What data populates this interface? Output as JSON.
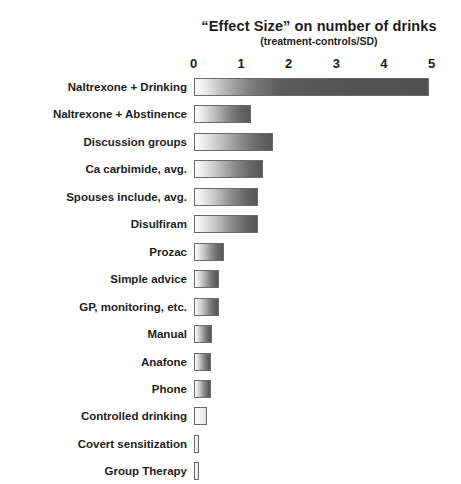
{
  "chart_data": {
    "type": "bar",
    "orientation": "horizontal",
    "title": "“Effect Size” on number of drinks",
    "subtitle": "(treatment-controls/SD)",
    "xlabel": "",
    "ylabel": "",
    "xlim": [
      0,
      5
    ],
    "xticks": [
      0,
      1,
      2,
      3,
      4,
      5
    ],
    "xtick_labels": [
      "0",
      "1",
      "2",
      "3",
      "4",
      "5"
    ],
    "grid": false,
    "legend": false,
    "categories": [
      "Naltrexone + Drinking",
      "Naltrexone + Abstinence",
      "Discussion groups",
      "Ca carbimide, avg.",
      "Spouses include, avg.",
      "Disulfiram",
      "Prozac",
      "Simple advice",
      "GP, monitoring, etc.",
      "Manual",
      "Anafone",
      "Phone",
      "Controlled drinking",
      "Covert sensitization",
      "Group Therapy"
    ],
    "values": [
      4.95,
      1.2,
      1.67,
      1.45,
      1.36,
      1.36,
      0.64,
      0.53,
      0.53,
      0.39,
      0.37,
      0.36,
      0.28,
      0.1,
      0.1
    ],
    "bar_style": "white-to-dark-gray horizontal gradient with gray outline"
  },
  "axis": {
    "tick_labels": [
      "0",
      "1",
      "2",
      "3",
      "4",
      "5"
    ]
  },
  "colors": {
    "background": "#ffffff",
    "text": "#1d1d1d",
    "bar_outline": "#6b6b6b",
    "bar_gradient_start": "#fdfdfd",
    "bar_gradient_end": "#4f4f4f"
  }
}
